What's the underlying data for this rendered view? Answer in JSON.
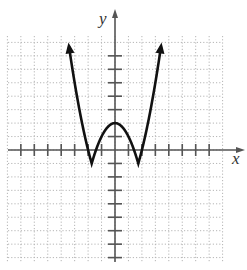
{
  "chart_data": {
    "type": "line",
    "title": "",
    "xlabel": "x",
    "ylabel": "y",
    "function": "y = |x^2 - 3| - 1",
    "xlim": [
      -7.9,
      7.9
    ],
    "ylim": [
      -8.3,
      8.5
    ],
    "grid": true,
    "grid_style": "dotted",
    "x_ticks": [
      -7,
      -6,
      -5,
      -4,
      -3,
      -2,
      -1,
      1,
      2,
      3,
      4,
      5,
      6,
      7
    ],
    "y_ticks": [
      -8,
      -7,
      -6,
      -5,
      -4,
      -3,
      -2,
      -1,
      1,
      3,
      4,
      5,
      6,
      7
    ],
    "key_points": [
      {
        "x": -3.5,
        "y": 8.25,
        "note": "arrow"
      },
      {
        "x": -1.73,
        "y": -1,
        "note": "local min (corner)"
      },
      {
        "x": 0,
        "y": 2,
        "note": "local max"
      },
      {
        "x": 1.73,
        "y": -1,
        "note": "local min (corner)"
      },
      {
        "x": 3.5,
        "y": 8.25,
        "note": "arrow"
      }
    ],
    "tick_labels_shown": false
  },
  "axes": {
    "x_label": "x",
    "y_label": "y"
  },
  "colors": {
    "curve": "#111111",
    "axis": "#555555",
    "grid": "#b5b5b5"
  }
}
